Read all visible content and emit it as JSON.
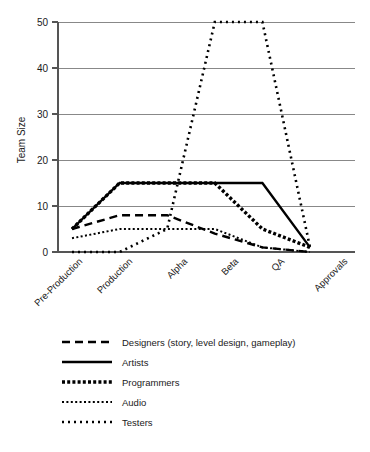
{
  "chart_data": {
    "type": "line",
    "title": "",
    "xlabel": "",
    "ylabel": "Team Size",
    "ylim": [
      0,
      50
    ],
    "yticks": [
      0,
      10,
      20,
      30,
      40,
      50
    ],
    "ytick_labels": [
      "0",
      "10",
      "20",
      "30",
      "40",
      "50"
    ],
    "grid": true,
    "legend_position": "bottom-left",
    "categories": [
      "Pre-Production",
      "Production",
      "Alpha",
      "Beta",
      "QA",
      "Approvals"
    ],
    "series": [
      {
        "name": "Designers (story, level design, gameplay)",
        "style": "dashed",
        "values": [
          5,
          8,
          8,
          4,
          1,
          0
        ]
      },
      {
        "name": "Artists",
        "style": "solid",
        "values": [
          5,
          15,
          15,
          15,
          15,
          1
        ]
      },
      {
        "name": "Programmers",
        "style": "thick-dotted",
        "values": [
          5,
          15,
          15,
          15,
          5,
          1
        ]
      },
      {
        "name": "Audio",
        "style": "thin-dotted",
        "values": [
          3,
          5,
          5,
          5,
          1,
          0
        ]
      },
      {
        "name": "Testers",
        "style": "sparse-dotted",
        "values": [
          0,
          0,
          5,
          50,
          50,
          1
        ]
      }
    ]
  },
  "axis": {
    "y_title": "Team Size",
    "y_tick_labels": [
      "0",
      "10",
      "20",
      "30",
      "40",
      "50"
    ],
    "x_tick_labels": [
      "Pre-Production",
      "Production",
      "Alpha",
      "Beta",
      "QA",
      "Approvals"
    ]
  },
  "legend": {
    "entries": [
      {
        "label": "Designers (story, level design, gameplay)",
        "swatch": "dashed-line-swatch"
      },
      {
        "label": "Artists",
        "swatch": "solid-line-swatch"
      },
      {
        "label": "Programmers",
        "swatch": "thick-dotted-line-swatch"
      },
      {
        "label": "Audio",
        "swatch": "thin-dotted-line-swatch"
      },
      {
        "label": "Testers",
        "swatch": "sparse-dotted-line-swatch"
      }
    ]
  },
  "colors": {
    "ink": "#000000",
    "grid": "#888888",
    "axis": "#555555",
    "background": "#ffffff"
  }
}
